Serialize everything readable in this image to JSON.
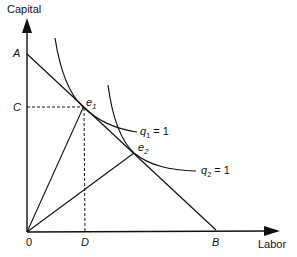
{
  "diagram": {
    "type": "isoquant-factor-intensity",
    "axes": {
      "y_label": "Capital",
      "x_label": "Labor",
      "origin_label": "0"
    },
    "points": {
      "A": "A",
      "B": "B",
      "C": "C",
      "D": "D",
      "e1": {
        "base": "e",
        "sub": "1"
      },
      "e2": {
        "base": "e",
        "sub": "2"
      }
    },
    "curves": {
      "q1": {
        "base": "q",
        "sub": "1",
        "rest": " = 1"
      },
      "q2": {
        "base": "q",
        "sub": "2",
        "rest": " = 1"
      }
    },
    "colors": {
      "ink": "#111111",
      "background": "#ffffff"
    }
  }
}
